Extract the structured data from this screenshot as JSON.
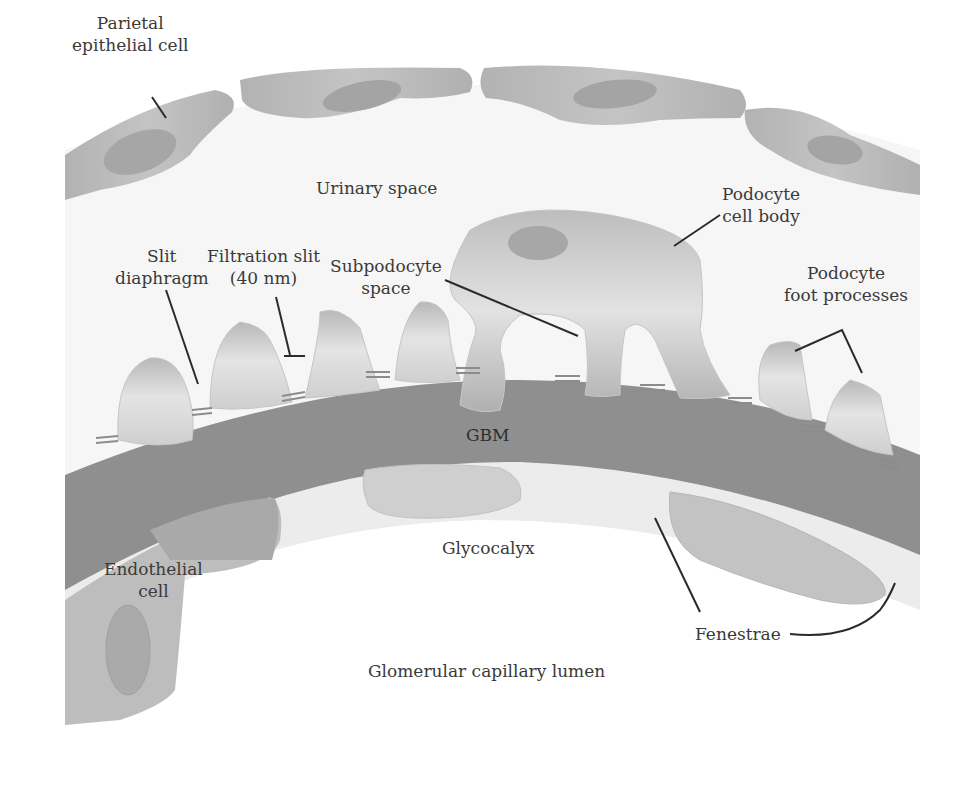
{
  "diagram": {
    "colors": {
      "background": "#ffffff",
      "urinary_space": "#f4f4f4",
      "parietal_cell": "#b9b9b9",
      "parietal_nucleus": "#a2a2a2",
      "podocyte_light": "#e6e6e6",
      "podocyte_dark": "#a9a9a9",
      "gbm": "#8f8f8f",
      "glycocalyx": "#e8e8e8",
      "endothelium": "#bdbdbd",
      "endothelial_nucleus": "#aaaaaa",
      "leader_line": "#2b2b2b",
      "text": "#3a3a3a"
    },
    "labels": {
      "parietal": {
        "line1": "Parietal",
        "line2": "epithelial cell"
      },
      "urinary_space": "Urinary space",
      "podocyte_body": {
        "line1": "Podocyte",
        "line2": "cell body"
      },
      "slit_diaphragm": {
        "line1": "Slit",
        "line2": "diaphragm"
      },
      "filtration_slit": {
        "line1": "Filtration slit",
        "line2": "(40 nm)"
      },
      "subpodocyte": {
        "line1": "Subpodocyte",
        "line2": "space"
      },
      "foot_processes": {
        "line1": "Podocyte",
        "line2": "foot processes"
      },
      "gbm": "GBM",
      "glycocalyx": "Glycocalyx",
      "endothelial": {
        "line1": "Endothelial",
        "line2": "cell"
      },
      "fenestrae": "Fenestrae",
      "lumen": "Glomerular capillary lumen"
    }
  }
}
